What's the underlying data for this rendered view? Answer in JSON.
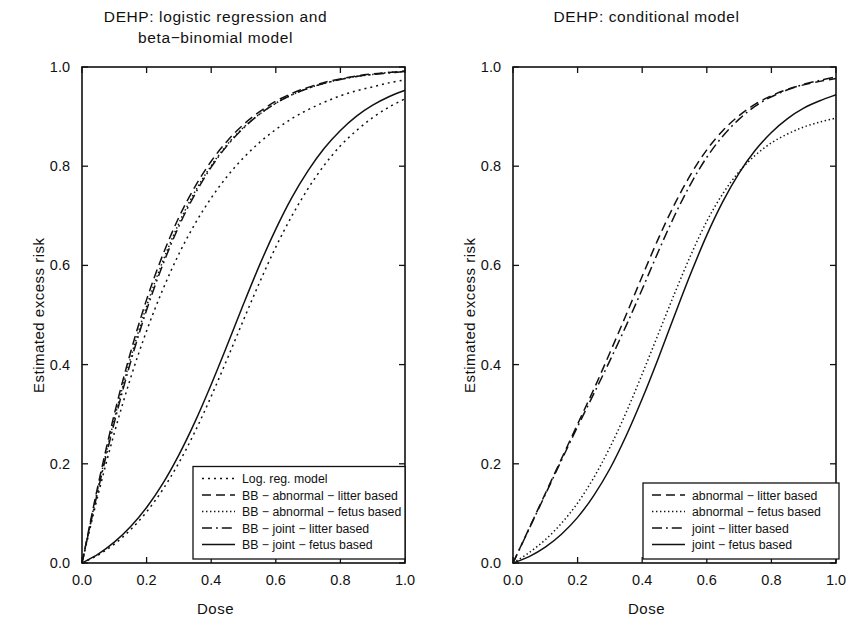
{
  "figure": {
    "axis_x_label": "Dose",
    "axis_y_label": "Estimated excess risk"
  },
  "panels": {
    "left": {
      "title": "DEHP:  logistic regression and\nbeta−binomial model",
      "xlabel": "Dose",
      "ylabel": "Estimated excess risk"
    },
    "right": {
      "title": "DEHP:  conditional model",
      "xlabel": "Dose",
      "ylabel": "Estimated excess risk"
    }
  },
  "ticks": {
    "x": [
      "0.0",
      "0.2",
      "0.4",
      "0.6",
      "0.8",
      "1.0"
    ],
    "y": [
      "0.0",
      "0.2",
      "0.4",
      "0.6",
      "0.8",
      "1.0"
    ]
  },
  "chart_data": [
    {
      "type": "line",
      "panel": "left",
      "title": "DEHP:  logistic regression and beta−binomial model",
      "xlabel": "Dose",
      "ylabel": "Estimated excess risk",
      "xlim": [
        0.0,
        1.0
      ],
      "ylim": [
        0.0,
        1.0
      ],
      "grid": false,
      "legend_position": "bottom-center",
      "x": [
        0.0,
        0.05,
        0.1,
        0.15,
        0.2,
        0.25,
        0.3,
        0.35,
        0.4,
        0.45,
        0.5,
        0.55,
        0.6,
        0.65,
        0.7,
        0.75,
        0.8,
        0.85,
        0.9,
        0.95,
        1.0
      ],
      "series": [
        {
          "name": "Log. reg. model",
          "style": "dotted",
          "values": [
            0.0,
            0.138,
            0.262,
            0.372,
            0.468,
            0.551,
            0.623,
            0.684,
            0.736,
            0.78,
            0.817,
            0.848,
            0.874,
            0.896,
            0.914,
            0.929,
            0.942,
            0.952,
            0.96,
            0.968,
            0.974
          ]
        },
        {
          "name": "BB − abnormal − litter based",
          "style": "dashed",
          "values": [
            0.0,
            0.158,
            0.3,
            0.424,
            0.531,
            0.621,
            0.697,
            0.759,
            0.81,
            0.851,
            0.884,
            0.91,
            0.931,
            0.947,
            0.959,
            0.969,
            0.976,
            0.982,
            0.986,
            0.989,
            0.992
          ]
        },
        {
          "name": "BB − abnormal − fetus based",
          "style": "fine-dotted",
          "values": [
            0.0,
            0.152,
            0.29,
            0.412,
            0.518,
            0.608,
            0.685,
            0.749,
            0.801,
            0.844,
            0.878,
            0.905,
            0.927,
            0.944,
            0.957,
            0.967,
            0.975,
            0.981,
            0.985,
            0.989,
            0.991
          ]
        },
        {
          "name": "BB − joint − litter based",
          "style": "dash-dot",
          "values": [
            0.0,
            0.148,
            0.283,
            0.404,
            0.51,
            0.601,
            0.679,
            0.744,
            0.798,
            0.842,
            0.877,
            0.905,
            0.927,
            0.944,
            0.957,
            0.967,
            0.975,
            0.981,
            0.985,
            0.988,
            0.991
          ]
        },
        {
          "name": "BB − joint − fetus based",
          "style": "solid",
          "values": [
            0.0,
            0.018,
            0.042,
            0.073,
            0.112,
            0.16,
            0.218,
            0.285,
            0.36,
            0.44,
            0.522,
            0.601,
            0.673,
            0.737,
            0.791,
            0.836,
            0.872,
            0.901,
            0.923,
            0.94,
            0.953
          ]
        },
        {
          "name": "Log. reg. model (lower branch)",
          "style": "dotted",
          "values": [
            0.0,
            0.016,
            0.038,
            0.067,
            0.103,
            0.148,
            0.202,
            0.265,
            0.336,
            0.412,
            0.49,
            0.566,
            0.637,
            0.7,
            0.755,
            0.802,
            0.841,
            0.872,
            0.898,
            0.919,
            0.936
          ]
        }
      ]
    },
    {
      "type": "line",
      "panel": "right",
      "title": "DEHP:  conditional model",
      "xlabel": "Dose",
      "ylabel": "Estimated excess risk",
      "xlim": [
        0.0,
        1.0
      ],
      "ylim": [
        0.0,
        1.0
      ],
      "grid": false,
      "legend_position": "bottom-center",
      "x": [
        0.0,
        0.05,
        0.1,
        0.15,
        0.2,
        0.25,
        0.3,
        0.35,
        0.4,
        0.45,
        0.5,
        0.55,
        0.6,
        0.65,
        0.7,
        0.75,
        0.8,
        0.85,
        0.9,
        0.95,
        1.0
      ],
      "series": [
        {
          "name": "abnormal − litter based",
          "style": "dashed",
          "values": [
            0.0,
            0.07,
            0.14,
            0.21,
            0.28,
            0.35,
            0.424,
            0.5,
            0.578,
            0.654,
            0.723,
            0.783,
            0.833,
            0.872,
            0.902,
            0.925,
            0.942,
            0.955,
            0.964,
            0.971,
            0.977
          ]
        },
        {
          "name": "abnormal − fetus based",
          "style": "fine-dotted",
          "values": [
            0.0,
            0.021,
            0.047,
            0.08,
            0.121,
            0.172,
            0.233,
            0.303,
            0.381,
            0.462,
            0.543,
            0.62,
            0.689,
            0.745,
            0.789,
            0.822,
            0.847,
            0.865,
            0.879,
            0.889,
            0.897
          ]
        },
        {
          "name": "joint − litter based",
          "style": "dash-dot",
          "values": [
            0.0,
            0.069,
            0.138,
            0.207,
            0.275,
            0.341,
            0.408,
            0.478,
            0.552,
            0.628,
            0.7,
            0.764,
            0.818,
            0.861,
            0.895,
            0.921,
            0.94,
            0.954,
            0.965,
            0.973,
            0.98
          ]
        },
        {
          "name": "joint − fetus based",
          "style": "solid",
          "values": [
            0.0,
            0.013,
            0.032,
            0.058,
            0.092,
            0.136,
            0.19,
            0.256,
            0.331,
            0.413,
            0.499,
            0.583,
            0.661,
            0.729,
            0.786,
            0.832,
            0.868,
            0.896,
            0.917,
            0.932,
            0.944
          ]
        }
      ]
    }
  ],
  "legends": {
    "left": {
      "entries": [
        {
          "label": "Log. reg. model",
          "style": "dotted"
        },
        {
          "label": "BB − abnormal − litter based",
          "style": "dashed"
        },
        {
          "label": "BB − abnormal − fetus based",
          "style": "fine-dotted"
        },
        {
          "label": "BB − joint − litter based",
          "style": "dash-dot"
        },
        {
          "label": "BB − joint − fetus based",
          "style": "solid"
        }
      ]
    },
    "right": {
      "entries": [
        {
          "label": "abnormal − litter based",
          "style": "dashed"
        },
        {
          "label": "abnormal − fetus based",
          "style": "fine-dotted"
        },
        {
          "label": "joint − litter based",
          "style": "dash-dot"
        },
        {
          "label": "joint − fetus based",
          "style": "solid"
        }
      ]
    }
  },
  "colors": {
    "ink": "#111111",
    "background": "#ffffff"
  }
}
